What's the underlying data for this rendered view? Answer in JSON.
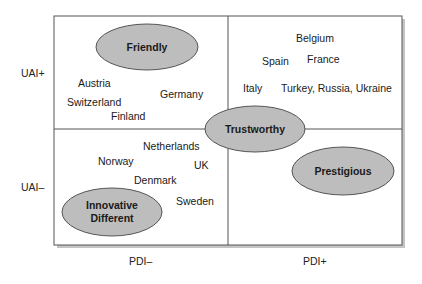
{
  "axes": {
    "y_top": "UAI+",
    "y_bottom": "UAI–",
    "x_left": "PDI–",
    "x_right": "PDI+"
  },
  "quadrants": {
    "top_left": {
      "countries": [
        "Austria",
        "Switzerland",
        "Finland",
        "Germany"
      ]
    },
    "top_right": {
      "countries": [
        "Belgium",
        "Spain",
        "France",
        "Italy",
        "Turkey, Russia, Ukraine"
      ]
    },
    "bottom_left": {
      "countries": [
        "Netherlands",
        "Norway",
        "UK",
        "Denmark",
        "Sweden"
      ]
    },
    "bottom_right": {
      "countries": []
    }
  },
  "clusters": {
    "friendly": "Friendly",
    "trustworthy": "Trustworthy",
    "prestigious": "Prestigious",
    "innovative_line1": "Innovative",
    "innovative_line2": "Different"
  },
  "colors": {
    "ellipse_fill": "#bdbdbd",
    "ellipse_stroke": "#555555",
    "frame": "#555555",
    "shadow": "#b5b5b5"
  }
}
